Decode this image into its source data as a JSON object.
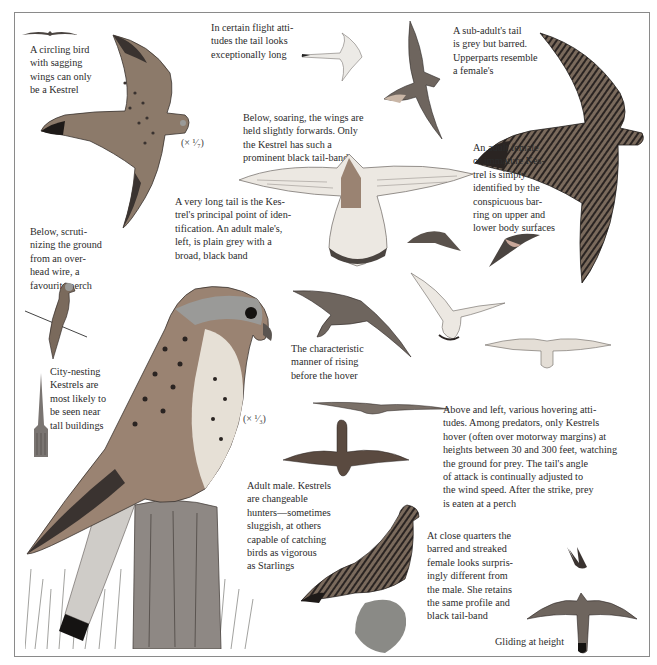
{
  "plate": {
    "subject": "Kestrel identification plate",
    "border_color": "#8a8a8a"
  },
  "captions": {
    "circling": "A circling bird\nwith sagging\nwings can only\nbe a Kestrel",
    "long_tail_flight": "In certain flight atti-\ntudes the tail looks\nexceptionally long",
    "sub_adult": "A sub-adult's tail\nis grey but barred.\nUpperparts resemble\na female's",
    "soaring": "Below, soaring, the wings are\nheld slightly forwards. Only\nthe Kestrel has such a\nprominent black tail-band",
    "adult_female": "An adult female\nor immature Kes-\ntrel is simply\nidentified by the\nconspicuous bar-\nring on upper and\nlower body surfaces",
    "very_long_tail": "A very long tail is the Kes-\ntrel's principal point of iden-\ntification. An adult male's,\nleft, is plain grey with a\nbroad, black band",
    "wire_perch": "Below, scruti-\nnizing the ground\nfrom an over-\nhead wire, a\nfavourite perch",
    "city_nesting": "City-nesting\nKestrels are\nmost likely to\nbe seen near\ntall buildings",
    "rising": "The characteristic\nmanner of rising\nbefore the hover",
    "hovering": "Above and left, various hovering atti-\ntudes. Among predators, only Kestrels\nhover (often over motorway margins) at\nheights between 30 and 300 feet, watching\nthe ground for prey. The tail's angle\nof attack is continually adjusted to\nthe wind speed. After the strike, prey\nis eaten at a perch",
    "adult_male": "Adult male. Kestrels\nare changeable\nhunters—sometimes\nsluggish, at others\ncapable of catching\nbirds as vigorous\nas Starlings",
    "close_quarters": "At close quarters the\nbarred and streaked\nfemale looks surpris-\ningly different from\nthe male. She retains\nthe same profile and\nblack tail-band",
    "gliding": "Gliding at height"
  },
  "scales": {
    "flying_male": "(× ¹⁄₇)",
    "perched_male": "(× ¹⁄₃)"
  },
  "colors": {
    "male_back": "#8c7a6a",
    "grey_head": "#9a9a98",
    "dark_barring": "#3a3330",
    "pale_underparts": "#e6e0d6",
    "grass": "#8a8a86"
  }
}
